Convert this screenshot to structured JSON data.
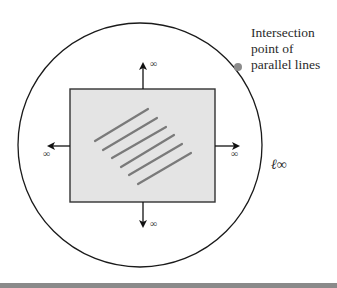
{
  "figure": {
    "callout": {
      "line1": "Intersection",
      "line2": "point of",
      "line3": "parallel lines"
    },
    "infinity_labels": {
      "up": "∞",
      "down": "∞",
      "left": "∞",
      "right": "∞"
    },
    "line_at_infinity_label": "ℓ∞",
    "colors": {
      "circle_stroke": "#1a1a1a",
      "plane_fill": "#e4e4e4",
      "plane_stroke": "#333333",
      "parallel_lines": "#7a7a7a",
      "intersection_dot": "#8c8c8c",
      "bottom_bar": "#8a8a8a"
    },
    "parallel_line_count": 6
  }
}
